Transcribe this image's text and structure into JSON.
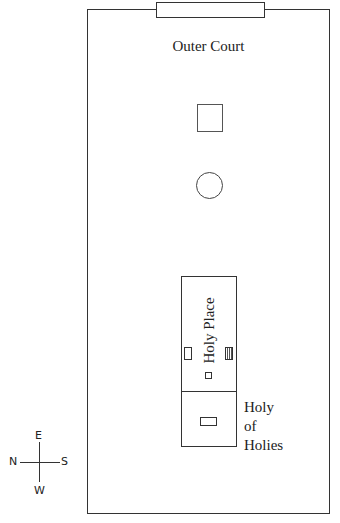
{
  "diagram": {
    "outer_court": {
      "label": "Outer Court"
    },
    "gate": {
      "name": "gate"
    },
    "altar": {
      "shape": "square"
    },
    "laver": {
      "shape": "circle"
    },
    "tabernacle": {
      "holy_place": {
        "label": "Holy Place"
      },
      "holy_of_holies": {
        "line1": "Holy",
        "line2": "of",
        "line3": "Holies"
      }
    },
    "compass": {
      "north": "N",
      "south": "S",
      "east": "E",
      "west": "W"
    }
  }
}
